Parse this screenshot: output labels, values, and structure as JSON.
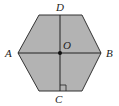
{
  "diagram": {
    "shape": "hexagon",
    "fill_color": "#b3b3b3",
    "stroke_color": "#333333",
    "points": {
      "A": {
        "label": "A"
      },
      "B": {
        "label": "B"
      },
      "C": {
        "label": "C"
      },
      "D": {
        "label": "D"
      },
      "O": {
        "label": "O"
      }
    },
    "segments": [
      "AB",
      "DC"
    ],
    "annotations": [
      "right-angle marker at C"
    ]
  }
}
